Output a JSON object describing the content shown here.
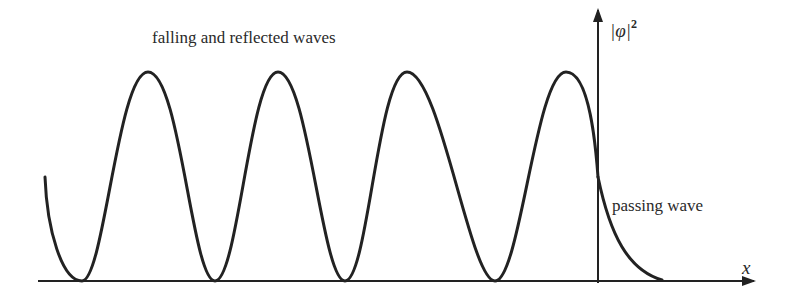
{
  "diagram": {
    "title": "falling and reflected waves",
    "passing_label": "passing wave",
    "x_axis_label": "x",
    "y_axis_label": "|φ|",
    "y_axis_exponent": "2",
    "colors": {
      "stroke": "#222222",
      "text": "#2a2a2a",
      "background": "#ffffff"
    },
    "geometry": {
      "x_axis": {
        "y": 281,
        "x_start": 38,
        "x_end": 752
      },
      "y_axis": {
        "x": 598,
        "y_start": 281,
        "y_end": 10
      },
      "wave_peaks_x": [
        148,
        278,
        407,
        566
      ],
      "wave_minima_x": [
        82,
        215,
        345,
        495
      ],
      "peak_y": 72,
      "baseline_y": 281,
      "curve_start": [
        45,
        177
      ],
      "decay_end_x": 662
    }
  }
}
